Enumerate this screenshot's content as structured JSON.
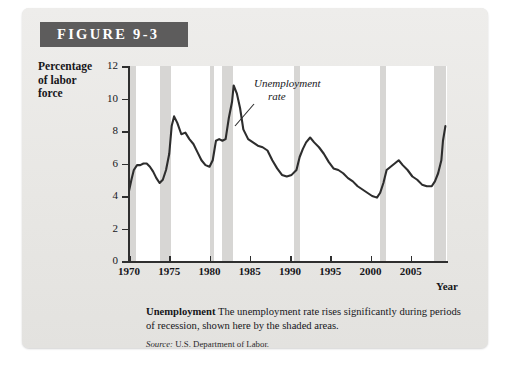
{
  "figure": {
    "badge_label": "FIGURE 9-3",
    "caption_title": "Unemployment",
    "caption_body": "The unemployment rate rises significantly during periods of recession, shown here by the shaded areas.",
    "source_prefix": "Source:",
    "source_text": "U.S. Department of Labor."
  },
  "annotation": {
    "line1": "Unemployment",
    "line2": "rate"
  },
  "axis_title": {
    "line1": "Percentage",
    "line2": "of labor",
    "line3": "force"
  },
  "colors": {
    "card_background": "#e9e8e6",
    "badge_background": "#5d5c5c",
    "badge_text": "#ffffff",
    "plot_background": "#ffffff",
    "recession_band": "#d7d6d4",
    "series_line": "#2d2d2d",
    "axis": "#2f2f2f"
  },
  "chart_data": {
    "type": "line",
    "title": "Unemployment",
    "xlabel": "Year",
    "ylabel": "Percentage of labor force",
    "xlim": [
      1970,
      2009.5
    ],
    "ylim": [
      0,
      12
    ],
    "ytick_labels": [
      "0",
      "2",
      "4",
      "6",
      "8",
      "10",
      "12"
    ],
    "yticks": [
      0,
      2,
      4,
      6,
      8,
      10,
      12
    ],
    "xtick_labels": [
      "1970",
      "1975",
      "1980",
      "1985",
      "1990",
      "1995",
      "2000",
      "2005"
    ],
    "xticks": [
      1970,
      1975,
      1980,
      1985,
      1990,
      1995,
      2000,
      2005
    ],
    "grid": false,
    "legend": "none",
    "annotations": [
      {
        "text": "Unemployment rate",
        "x": 1984.5,
        "y": 11.3,
        "style": "italic",
        "leader_to": {
          "x": 1983.2,
          "y": 9.6
        }
      }
    ],
    "shaded_regions_label": "Recessions",
    "shaded_regions": [
      {
        "start": 1969.9,
        "end": 1970.9
      },
      {
        "start": 1973.9,
        "end": 1975.2
      },
      {
        "start": 1980.0,
        "end": 1980.6
      },
      {
        "start": 1981.5,
        "end": 1982.9
      },
      {
        "start": 1990.5,
        "end": 1991.2
      },
      {
        "start": 2001.2,
        "end": 2001.9
      },
      {
        "start": 2007.9,
        "end": 2009.4
      }
    ],
    "series": [
      {
        "name": "Unemployment rate",
        "units": "percent of labor force",
        "x": [
          1970.0,
          1970.3,
          1970.6,
          1971.0,
          1971.4,
          1971.8,
          1972.2,
          1972.6,
          1973.0,
          1973.4,
          1973.8,
          1974.2,
          1974.6,
          1975.0,
          1975.3,
          1975.6,
          1976.0,
          1976.5,
          1977.0,
          1977.5,
          1978.0,
          1978.5,
          1979.0,
          1979.5,
          1980.0,
          1980.4,
          1980.8,
          1981.2,
          1981.6,
          1982.0,
          1982.4,
          1982.8,
          1983.0,
          1983.4,
          1983.8,
          1984.2,
          1984.8,
          1985.4,
          1986.0,
          1986.6,
          1987.2,
          1987.8,
          1988.4,
          1989.0,
          1989.6,
          1990.2,
          1990.8,
          1991.2,
          1991.6,
          1992.0,
          1992.5,
          1993.0,
          1993.6,
          1994.2,
          1994.8,
          1995.4,
          1996.0,
          1996.6,
          1997.2,
          1997.8,
          1998.4,
          1999.0,
          1999.6,
          2000.2,
          2000.8,
          2001.2,
          2001.6,
          2002.0,
          2002.5,
          2003.0,
          2003.5,
          2004.0,
          2004.6,
          2005.2,
          2005.8,
          2006.4,
          2007.0,
          2007.6,
          2008.0,
          2008.4,
          2008.8,
          2009.0,
          2009.3
        ],
        "y": [
          4.3,
          5.0,
          5.6,
          5.9,
          5.9,
          6.0,
          6.0,
          5.8,
          5.5,
          5.1,
          4.8,
          5.0,
          5.6,
          6.6,
          8.3,
          8.9,
          8.5,
          7.8,
          7.9,
          7.5,
          7.2,
          6.7,
          6.2,
          5.9,
          5.8,
          6.2,
          7.4,
          7.5,
          7.4,
          7.5,
          8.8,
          9.8,
          10.8,
          10.3,
          9.4,
          8.1,
          7.5,
          7.3,
          7.1,
          7.0,
          6.8,
          6.2,
          5.7,
          5.3,
          5.2,
          5.3,
          5.6,
          6.4,
          6.9,
          7.3,
          7.6,
          7.3,
          7.0,
          6.6,
          6.1,
          5.7,
          5.6,
          5.4,
          5.1,
          4.9,
          4.6,
          4.4,
          4.2,
          4.0,
          3.9,
          4.2,
          4.8,
          5.6,
          5.8,
          6.0,
          6.2,
          5.9,
          5.6,
          5.2,
          5.0,
          4.7,
          4.6,
          4.6,
          4.9,
          5.4,
          6.2,
          7.4,
          8.3
        ]
      }
    ]
  }
}
